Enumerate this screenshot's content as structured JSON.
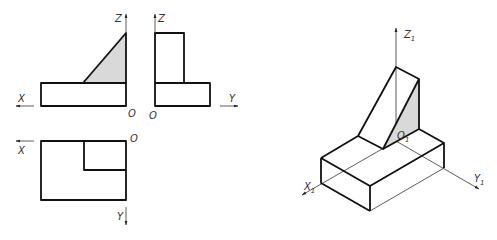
{
  "figure": {
    "type": "three-view orthographic projection with isometric drawing",
    "colors": {
      "line": "#111111",
      "shade": "#d9d9d9",
      "background": "#ffffff"
    }
  },
  "front_view": {
    "axis_x_label": "X",
    "axis_z_label": "Z",
    "origin_label": "O"
  },
  "side_view": {
    "axis_y_label": "Y",
    "axis_z_label": "Z",
    "origin_label": "O"
  },
  "top_view": {
    "axis_x_label": "X",
    "axis_y_label": "Y",
    "origin_label": "O"
  },
  "isometric_view": {
    "axis_x_label": "X",
    "axis_x_sub": "1",
    "axis_y_label": "Y",
    "axis_y_sub": "1",
    "axis_z_label": "Z",
    "axis_z_sub": "1",
    "origin_label": "O",
    "origin_sub": "1"
  }
}
